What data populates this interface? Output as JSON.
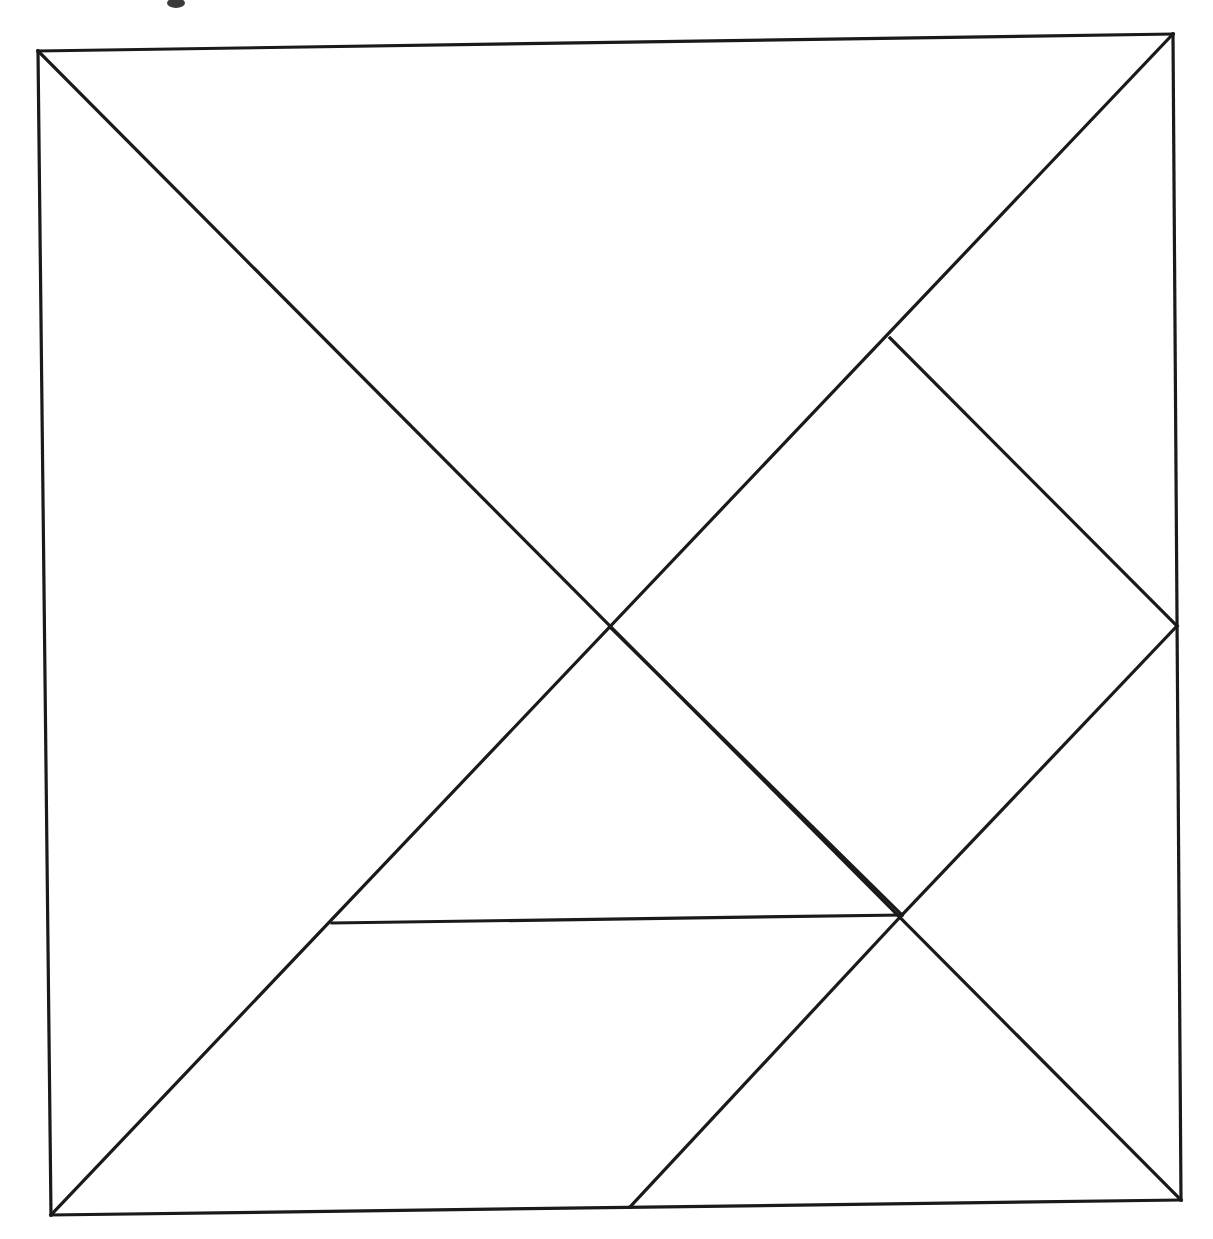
{
  "figure": {
    "type": "line-diagram",
    "background_color": "#ffffff",
    "stroke_color": "#1a1a1a",
    "stroke_width": 3.2,
    "canvas": {
      "width": 1213,
      "height": 1239
    }
  },
  "chart_data": {
    "type": "diagram",
    "xlabel": "",
    "ylabel": "",
    "coordinate_space": {
      "width": 1213,
      "height": 1239,
      "units": "pixels"
    },
    "vertices": {
      "square_top_left": [
        38,
        51
      ],
      "square_top_right": [
        1173,
        34
      ],
      "square_bottom_right": [
        1181,
        1200
      ],
      "square_bottom_left": [
        51,
        1215
      ],
      "center": [
        610,
        627
      ],
      "diamond_top": [
        890,
        338
      ],
      "diamond_right": [
        1177,
        626
      ],
      "diamond_bottom": [
        902,
        915
      ],
      "horizontal_left_end": [
        332,
        923
      ],
      "bottom_edge_split": [
        630,
        1207
      ]
    },
    "segments": [
      {
        "name": "square-edge-top",
        "from": [
          38,
          51
        ],
        "to": [
          1173,
          34
        ]
      },
      {
        "name": "square-edge-right",
        "from": [
          1173,
          34
        ],
        "to": [
          1181,
          1200
        ]
      },
      {
        "name": "square-edge-bottom",
        "from": [
          1181,
          1200
        ],
        "to": [
          51,
          1215
        ]
      },
      {
        "name": "square-edge-left",
        "from": [
          51,
          1215
        ],
        "to": [
          38,
          51
        ]
      },
      {
        "name": "main-diagonal-tl-br",
        "from": [
          38,
          51
        ],
        "to": [
          1181,
          1200
        ]
      },
      {
        "name": "anti-diagonal-tr-bl",
        "from": [
          1173,
          34
        ],
        "to": [
          51,
          1215
        ]
      },
      {
        "name": "inner-square-upper-right",
        "from": [
          890,
          338
        ],
        "to": [
          1177,
          626
        ]
      },
      {
        "name": "inner-square-lower-right",
        "from": [
          1177,
          626
        ],
        "to": [
          902,
          915
        ]
      },
      {
        "name": "inner-square-lower-left",
        "from": [
          902,
          915
        ],
        "to": [
          610,
          627
        ]
      },
      {
        "name": "horizontal-chord",
        "from": [
          332,
          923
        ],
        "to": [
          902,
          915
        ]
      },
      {
        "name": "lower-cut-to-bottom-edge",
        "from": [
          902,
          915
        ],
        "to": [
          630,
          1207
        ]
      }
    ],
    "pieces": [
      {
        "name": "large-triangle-upper-left",
        "points": [
          [
            38,
            51
          ],
          [
            1173,
            34
          ],
          [
            610,
            627
          ]
        ]
      },
      {
        "name": "large-triangle-lower-left",
        "points": [
          [
            38,
            51
          ],
          [
            610,
            627
          ],
          [
            51,
            1215
          ]
        ]
      },
      {
        "name": "medium-triangle-upper-right",
        "points": [
          [
            890,
            338
          ],
          [
            1177,
            626
          ],
          [
            610,
            627
          ]
        ]
      },
      {
        "name": "small-triangle-center",
        "points": [
          [
            610,
            627
          ],
          [
            902,
            915
          ],
          [
            332,
            923
          ]
        ]
      },
      {
        "name": "square-piece",
        "points": [
          [
            610,
            627
          ],
          [
            1177,
            626
          ],
          [
            902,
            915
          ]
        ]
      },
      {
        "name": "parallelogram-lower",
        "points": [
          [
            902,
            915
          ],
          [
            1181,
            1200
          ],
          [
            630,
            1207
          ]
        ]
      },
      {
        "name": "triangle-lower-strip",
        "points": [
          [
            332,
            923
          ],
          [
            902,
            915
          ],
          [
            630,
            1207
          ],
          [
            51,
            1215
          ]
        ]
      }
    ],
    "counts": {
      "total_line_segments": 11,
      "square_outline_segments": 4,
      "interior_cut_segments": 7,
      "visible_intersection_points": 5
    },
    "grid": false,
    "legend": null,
    "annotations": []
  },
  "artifacts": {
    "speck_top": {
      "cx": 176,
      "cy": 3,
      "rx": 9,
      "ry": 5
    }
  }
}
